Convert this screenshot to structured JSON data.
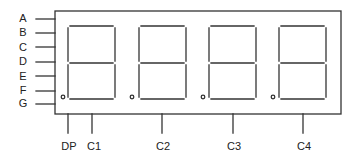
{
  "diagram": {
    "left_pins": [
      {
        "label": "A",
        "y": 19
      },
      {
        "label": "B",
        "y": 33
      },
      {
        "label": "C",
        "y": 47
      },
      {
        "label": "D",
        "y": 62
      },
      {
        "label": "E",
        "y": 76
      },
      {
        "label": "F",
        "y": 91
      },
      {
        "label": "G",
        "y": 104
      }
    ],
    "bottom_pins": [
      {
        "label": "DP",
        "x": 68
      },
      {
        "label": "C1",
        "x": 92
      },
      {
        "label": "C2",
        "x": 162
      },
      {
        "label": "C3",
        "x": 233
      },
      {
        "label": "C4",
        "x": 303
      }
    ],
    "digits": [
      {
        "name": "digit-1",
        "left": 68,
        "right": 115,
        "dp_x": 63
      },
      {
        "name": "digit-2",
        "left": 139,
        "right": 186,
        "dp_x": 132
      },
      {
        "name": "digit-3",
        "left": 209,
        "right": 256,
        "dp_x": 203
      },
      {
        "name": "digit-4",
        "left": 279,
        "right": 326,
        "dp_x": 273
      }
    ],
    "line_color": "#333333"
  }
}
